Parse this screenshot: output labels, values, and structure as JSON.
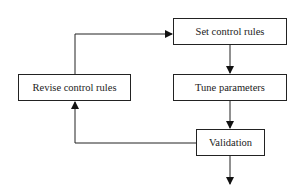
{
  "diagram": {
    "type": "flowchart",
    "nodes": {
      "set_rules": {
        "label": "Set control rules"
      },
      "tune_params": {
        "label": "Tune parameters"
      },
      "revise_rules": {
        "label": "Revise control rules"
      },
      "validation": {
        "label": "Validation"
      }
    },
    "edges": [
      {
        "from": "set_rules",
        "to": "tune_params"
      },
      {
        "from": "tune_params",
        "to": "validation"
      },
      {
        "from": "validation",
        "to": "revise_rules"
      },
      {
        "from": "revise_rules",
        "to": "set_rules"
      },
      {
        "from": "validation",
        "to": "output"
      }
    ],
    "colors": {
      "stroke": "#222222",
      "background": "#ffffff"
    }
  }
}
